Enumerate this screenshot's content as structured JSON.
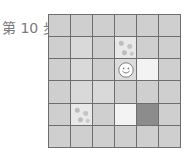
{
  "step_label": "第 10 步",
  "grid": {
    "rows": 6,
    "cols": 6,
    "cells": [
      [
        "normal",
        "normal",
        "normal",
        "normal",
        "normal",
        "normal"
      ],
      [
        "normal",
        "light",
        "normal",
        "textured",
        "normal",
        "normal"
      ],
      [
        "normal",
        "light",
        "normal",
        "agent",
        "white",
        "normal"
      ],
      [
        "normal",
        "light",
        "light",
        "normal",
        "normal",
        "normal"
      ],
      [
        "normal",
        "textured",
        "normal",
        "white",
        "dark",
        "normal"
      ],
      [
        "normal",
        "normal",
        "normal",
        "normal",
        "normal",
        "normal"
      ]
    ],
    "agent_position": {
      "row": 2,
      "col": 3
    },
    "agent_icon": "smiley-face-icon"
  },
  "colors": {
    "normal": "#cfcfcf",
    "light": "#d9d9d9",
    "white": "#f3f3f3",
    "dark": "#8c8c8c",
    "grid_line": "#6e6e6e"
  }
}
